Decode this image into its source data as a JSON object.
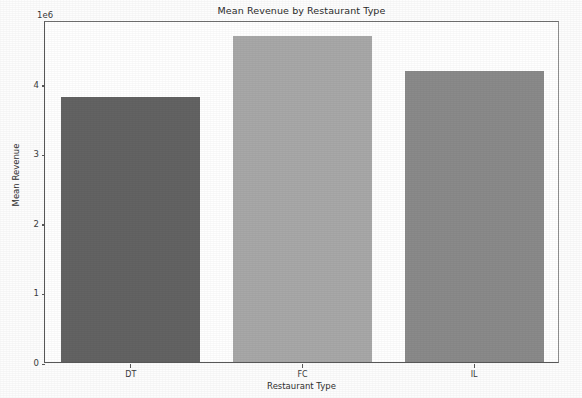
{
  "chart_data": {
    "type": "bar",
    "title": "Mean Revenue by Restaurant Type",
    "xlabel": "Restaurant Type",
    "ylabel": "Mean Revenue",
    "categories": [
      "DT",
      "FC",
      "IL"
    ],
    "values": [
      3810000,
      4690000,
      4190000
    ],
    "values_scaled": [
      3.81,
      4.69,
      4.19
    ],
    "y_offset_text": "1e6",
    "y_offset_multiplier": 1000000,
    "yticks": [
      0,
      1,
      2,
      3,
      4
    ],
    "ytick_labels": [
      "0",
      "1",
      "2",
      "3",
      "4"
    ],
    "ylim": [
      0,
      4.92
    ],
    "grid": false,
    "legend": null,
    "bar_colors": [
      "#636363",
      "#a8a8a8",
      "#8a8a8a"
    ],
    "bars": [
      {
        "category": "DT",
        "value_scaled": 3.81,
        "color": "#636363"
      },
      {
        "category": "FC",
        "value_scaled": 4.69,
        "color": "#a8a8a8"
      },
      {
        "category": "IL",
        "value_scaled": 4.19,
        "color": "#8a8a8a"
      }
    ]
  },
  "figure": {
    "background": "#fdfdfd",
    "axes_background": "#ffffff",
    "spine_color": "#585858",
    "text_color": "#2f2f2f"
  }
}
